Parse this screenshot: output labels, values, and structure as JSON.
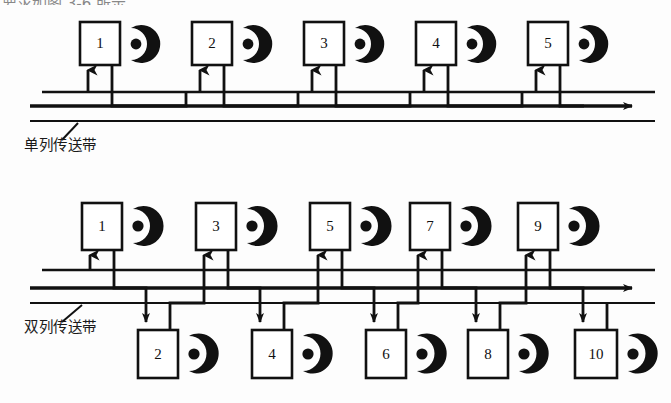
{
  "page": {
    "top_cropped_caption": "要求如图 3-6 所示。",
    "background_color": "#fdfdfd",
    "ink_color": "#111111"
  },
  "diagrams": [
    {
      "id": "single-row-conveyor",
      "label": "单列传送带",
      "label_translation": "single-row conveyor belt",
      "layout": "one row of stations above a single conveyor",
      "station_count": 5,
      "stations": [
        {
          "id": "1",
          "number": "1",
          "row": "top",
          "x": 80,
          "y": 22,
          "w": 40,
          "h": 43,
          "robot": true
        },
        {
          "id": "2",
          "number": "2",
          "row": "top",
          "x": 192,
          "y": 22,
          "w": 40,
          "h": 43,
          "robot": true
        },
        {
          "id": "3",
          "number": "3",
          "row": "top",
          "x": 304,
          "y": 22,
          "w": 40,
          "h": 43,
          "robot": true
        },
        {
          "id": "4",
          "number": "4",
          "row": "top",
          "x": 416,
          "y": 22,
          "w": 40,
          "h": 43,
          "robot": true
        },
        {
          "id": "5",
          "number": "5",
          "row": "top",
          "x": 528,
          "y": 22,
          "w": 40,
          "h": 43,
          "robot": true
        }
      ],
      "rails": [
        {
          "name": "upper-rail",
          "y": 92,
          "x1": 42,
          "x2": 655
        },
        {
          "name": "middle-rail",
          "y": 106,
          "x1": 30,
          "x2": 640,
          "arrow_end": true
        },
        {
          "name": "lower-rail",
          "y": 121,
          "x1": 30,
          "x2": 655
        }
      ],
      "flow_direction": "left-to-right"
    },
    {
      "id": "double-row-conveyor",
      "label": "双列传送带",
      "label_translation": "double-row conveyor belt",
      "layout": "two staggered rows of stations straddling a double conveyor",
      "station_count": 10,
      "stations": [
        {
          "id": "1",
          "number": "1",
          "row": "top",
          "x": 82,
          "y": 203,
          "w": 40,
          "h": 47,
          "robot": true
        },
        {
          "id": "3",
          "number": "3",
          "row": "top",
          "x": 196,
          "y": 203,
          "w": 40,
          "h": 47,
          "robot": true
        },
        {
          "id": "5",
          "number": "5",
          "row": "top",
          "x": 310,
          "y": 203,
          "w": 40,
          "h": 47,
          "robot": true
        },
        {
          "id": "7",
          "number": "7",
          "row": "top",
          "x": 410,
          "y": 203,
          "w": 40,
          "h": 47,
          "robot": true
        },
        {
          "id": "9",
          "number": "9",
          "row": "top",
          "x": 518,
          "y": 203,
          "w": 40,
          "h": 47,
          "robot": true
        },
        {
          "id": "2",
          "number": "2",
          "row": "bottom",
          "x": 138,
          "y": 330,
          "w": 40,
          "h": 48,
          "robot": true
        },
        {
          "id": "4",
          "number": "4",
          "row": "bottom",
          "x": 252,
          "y": 330,
          "w": 40,
          "h": 48,
          "robot": true
        },
        {
          "id": "6",
          "number": "6",
          "row": "bottom",
          "x": 366,
          "y": 330,
          "w": 40,
          "h": 48,
          "robot": true
        },
        {
          "id": "8",
          "number": "8",
          "row": "bottom",
          "x": 468,
          "y": 330,
          "w": 40,
          "h": 48,
          "robot": true
        },
        {
          "id": "10",
          "number": "10",
          "row": "bottom",
          "x": 575,
          "y": 330,
          "w": 42,
          "h": 48,
          "robot": true
        }
      ],
      "rails": [
        {
          "name": "upper-rail",
          "y": 270,
          "x1": 42,
          "x2": 655
        },
        {
          "name": "middle-rail",
          "y": 288,
          "x1": 30,
          "x2": 640,
          "arrow_end": true
        },
        {
          "name": "lower-rail",
          "y": 303,
          "x1": 30,
          "x2": 655
        }
      ],
      "flow_direction": "left-to-right"
    }
  ],
  "legend": {
    "robot_icon_name": "robot-gripper-icon",
    "robot_icon_description": "filled crescent with dot representing a robot arm / gripper"
  }
}
